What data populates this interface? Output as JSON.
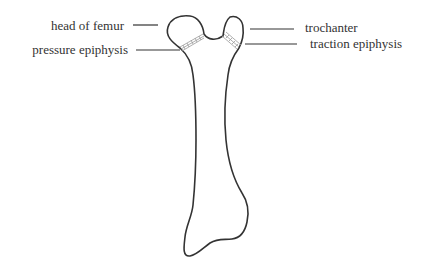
{
  "diagram": {
    "subject": "femur",
    "labels": {
      "head": "head of femur",
      "pressure": "pressure epiphysis",
      "trochanter": "trochanter",
      "traction": "traction epiphysis"
    },
    "colors": {
      "outline": "#333333",
      "epiphysis_hatch": "#9a9a9a",
      "text": "#333333",
      "background": "#ffffff"
    }
  }
}
